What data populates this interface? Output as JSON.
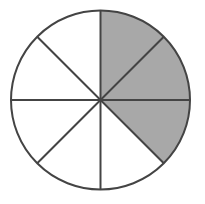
{
  "figure": {
    "background_color": "#ffffff"
  },
  "chart_data": {
    "type": "pie",
    "subtitle": "",
    "xlabel": "",
    "ylabel": "",
    "grid": false,
    "legend_position": "none",
    "center": {
      "x": 100.5,
      "y": 100.0
    },
    "radius": 89.5,
    "total_slices": 8,
    "slice_angle_degrees": 45,
    "shaded_count": 3,
    "unshaded_count": 5,
    "fraction_shaded": "3/8",
    "start_angle_degrees": 0,
    "direction": "clockwise",
    "categories": [
      "sector-1",
      "sector-2",
      "sector-3",
      "sector-4",
      "sector-5",
      "sector-6",
      "sector-7",
      "sector-8"
    ],
    "values": [
      1,
      1,
      1,
      1,
      1,
      1,
      1,
      1
    ],
    "series": [
      {
        "name": "shaded",
        "values": [
          1,
          1,
          1,
          0,
          0,
          0,
          0,
          0
        ]
      }
    ],
    "slices": [
      {
        "index": 1,
        "start_deg": 0,
        "end_deg": 45,
        "shaded": true,
        "fill": "#a8a8a8",
        "clock_label": "12:00-1:30"
      },
      {
        "index": 2,
        "start_deg": 45,
        "end_deg": 90,
        "shaded": true,
        "fill": "#a8a8a8",
        "clock_label": "1:30-3:00"
      },
      {
        "index": 3,
        "start_deg": 90,
        "end_deg": 135,
        "shaded": true,
        "fill": "#a8a8a8",
        "clock_label": "3:00-4:30"
      },
      {
        "index": 4,
        "start_deg": 135,
        "end_deg": 180,
        "shaded": false,
        "fill": "#ffffff",
        "clock_label": "4:30-6:00"
      },
      {
        "index": 5,
        "start_deg": 180,
        "end_deg": 225,
        "shaded": false,
        "fill": "#ffffff",
        "clock_label": "6:00-7:30"
      },
      {
        "index": 6,
        "start_deg": 225,
        "end_deg": 270,
        "shaded": false,
        "fill": "#ffffff",
        "clock_label": "7:30-9:00"
      },
      {
        "index": 7,
        "start_deg": 270,
        "end_deg": 315,
        "shaded": false,
        "fill": "#ffffff",
        "clock_label": "9:00-10:30"
      },
      {
        "index": 8,
        "start_deg": 315,
        "end_deg": 360,
        "shaded": false,
        "fill": "#ffffff",
        "clock_label": "10:30-12:00"
      }
    ],
    "spokes": [
      {
        "name": "spoke-vertical",
        "angle_deg": 0
      },
      {
        "name": "spoke-diagonal-ne-sw",
        "angle_deg": 45
      },
      {
        "name": "spoke-horizontal",
        "angle_deg": 90
      },
      {
        "name": "spoke-diagonal-nw-se",
        "angle_deg": 135
      }
    ],
    "colors": {
      "shaded_fill": "#a8a8a8",
      "unshaded_fill": "#ffffff",
      "stroke": "#444444",
      "background": "#ffffff"
    },
    "stroke_width": 2
  }
}
